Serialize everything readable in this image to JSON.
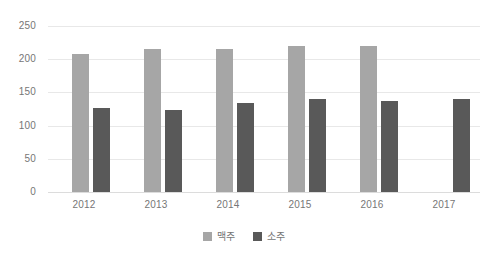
{
  "chart_data": {
    "type": "bar",
    "title": "",
    "subtitle": "",
    "xlabel": "",
    "ylabel": "",
    "categories": [
      "2012",
      "2013",
      "2014",
      "2015",
      "2016",
      "2017"
    ],
    "series": [
      {
        "name": "맥주",
        "color": "#a6a6a6",
        "values": [
          208,
          215,
          216,
          220,
          220,
          null
        ]
      },
      {
        "name": "소주",
        "color": "#595959",
        "values": [
          126,
          123,
          134,
          140,
          137,
          140
        ]
      }
    ],
    "ylim": [
      0,
      250
    ],
    "yticks": [
      0,
      50,
      100,
      150,
      200,
      250
    ],
    "ytick_labels": [
      "0",
      "50",
      "100",
      "150",
      "200",
      "250"
    ],
    "grid": true,
    "grid_axis": "y",
    "legend": {
      "position": "bottom",
      "entries": [
        "맥주",
        "소주"
      ]
    },
    "annotations": [],
    "background_color": "#ffffff",
    "gridline_color": "#e8e8e8",
    "axis_text_color": "#767676"
  },
  "legend": {
    "items": [
      {
        "label": "맥주",
        "swatch_name": "legend-swatch-maekju"
      },
      {
        "label": "소주",
        "swatch_name": "legend-swatch-soju"
      }
    ]
  }
}
